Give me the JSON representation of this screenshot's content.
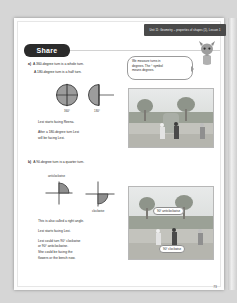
{
  "banner": {
    "text": "Unit 11: Geometry – properties of shapes (1), Lesson 1"
  },
  "section": {
    "tab_label": "Share"
  },
  "bubble": {
    "line1": "We measure turns in",
    "line2": "degrees. The ° symbol",
    "line3": "means degrees."
  },
  "part_a": {
    "label": "a)",
    "statement1": "A 360-degree turn is a whole turn.",
    "statement2": "A 180-degree turn is a half turn.",
    "diagram_labels": [
      "360°",
      "180°"
    ],
    "text1": "Lexi starts facing Reena.",
    "text2": "After a 180-degree turn Lexi",
    "text3": "will be facing Lexi."
  },
  "part_b": {
    "label": "b)",
    "statement1": "A 90-degree turn is a quarter turn.",
    "diagram_label_anticlockwise": "anticlockwise",
    "diagram_label_clockwise": "clockwise",
    "text1": "This is also called a right angle.",
    "text2": "Lexi starts facing Lexi.",
    "text3": "Lexi could turn 90° clockwise",
    "text4": "or 90° anticlockwise.",
    "text5": "She could be facing the",
    "text6": "flowers or the bench now."
  },
  "photo_tags": {
    "anticlockwise": "90° anticlockwise",
    "clockwise": "90° clockwise"
  },
  "page": {
    "number": "73"
  },
  "colors": {
    "banner_bg": "#4a4a4a",
    "tab_bg": "#2b2b2b",
    "text": "#1d1d1d",
    "paper": "#ffffff"
  }
}
